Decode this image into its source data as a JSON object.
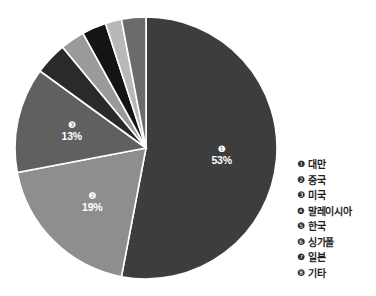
{
  "chart_data": {
    "type": "pie",
    "title": "",
    "subtitle": "",
    "xlabel": "",
    "ylabel": "",
    "legend_position": "right",
    "grid": false,
    "start_angle_deg": 0,
    "direction": "clockwise",
    "categories": [
      "대만",
      "중국",
      "미국",
      "말레이시아",
      "한국",
      "싱가폴",
      "일본",
      "기타"
    ],
    "values": [
      53,
      19,
      13,
      4,
      3,
      3,
      2,
      3
    ],
    "value_unit": "%",
    "slices": [
      {
        "index": 1,
        "marker": "❶",
        "label": "대만",
        "value": 53,
        "value_text": "53%",
        "color": "#3d3d3d",
        "label_tone": "on-dark"
      },
      {
        "index": 2,
        "marker": "❷",
        "label": "중국",
        "value": 19,
        "value_text": "19%",
        "color": "#8e8e8e",
        "label_tone": "on-light"
      },
      {
        "index": 3,
        "marker": "❸",
        "label": "미국",
        "value": 13,
        "value_text": "13%",
        "color": "#606060",
        "label_tone": "on-dark"
      },
      {
        "index": 4,
        "marker": "❹",
        "label": "말레이시아",
        "value": 4,
        "value_text": "4%",
        "color": "#2a2a2a",
        "label_tone": "on-dark"
      },
      {
        "index": 5,
        "marker": "❺",
        "label": "한국",
        "value": 3,
        "value_text": "3%",
        "color": "#9a9a9a",
        "label_tone": "on-light"
      },
      {
        "index": 6,
        "marker": "❻",
        "label": "싱가폴",
        "value": 3,
        "value_text": "3%",
        "color": "#141414",
        "label_tone": "on-dark"
      },
      {
        "index": 7,
        "marker": "❼",
        "label": "일본",
        "value": 2,
        "value_text": "2%",
        "color": "#b8b8b8",
        "label_tone": "on-light"
      },
      {
        "index": 8,
        "marker": "❽",
        "label": "기타",
        "value": 3,
        "value_text": "3%",
        "color": "#6b6b6b",
        "label_tone": "on-dark"
      }
    ]
  },
  "legend": {
    "items": [
      {
        "marker": "❶",
        "label": "대만"
      },
      {
        "marker": "❷",
        "label": "중국"
      },
      {
        "marker": "❸",
        "label": "미국"
      },
      {
        "marker": "❹",
        "label": "말레이시아"
      },
      {
        "marker": "❺",
        "label": "한국"
      },
      {
        "marker": "❻",
        "label": "싱가폴"
      },
      {
        "marker": "❼",
        "label": "일본"
      },
      {
        "marker": "❽",
        "label": "기타"
      }
    ]
  }
}
